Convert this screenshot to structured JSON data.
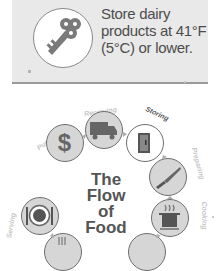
{
  "tip": {
    "icon": "key-icon",
    "text": "Store dairy products at 41°F (5°C) or lower."
  },
  "flow": {
    "title_lines": [
      "The",
      "Flow",
      "of",
      "Food"
    ],
    "steps": [
      {
        "label": "Purchasing",
        "icon": "dollar-icon"
      },
      {
        "label": "Receiving",
        "icon": "truck-icon"
      },
      {
        "label": "Storing",
        "icon": "refrigerator-icon"
      },
      {
        "label": "Preparing",
        "icon": "knife-icon"
      },
      {
        "label": "Cooking",
        "icon": "pot-icon"
      },
      {
        "label": "Holding",
        "icon": "holding-icon"
      },
      {
        "label": "Cooling",
        "icon": "cooling-icon"
      },
      {
        "label": "Serving",
        "icon": "plate-icon"
      }
    ]
  },
  "colors": {
    "box_bg": "#e9e9e9",
    "circle_fill": "#d6d6d6",
    "icon_fill": "#6a6a6a",
    "text": "#4d4d4d"
  }
}
